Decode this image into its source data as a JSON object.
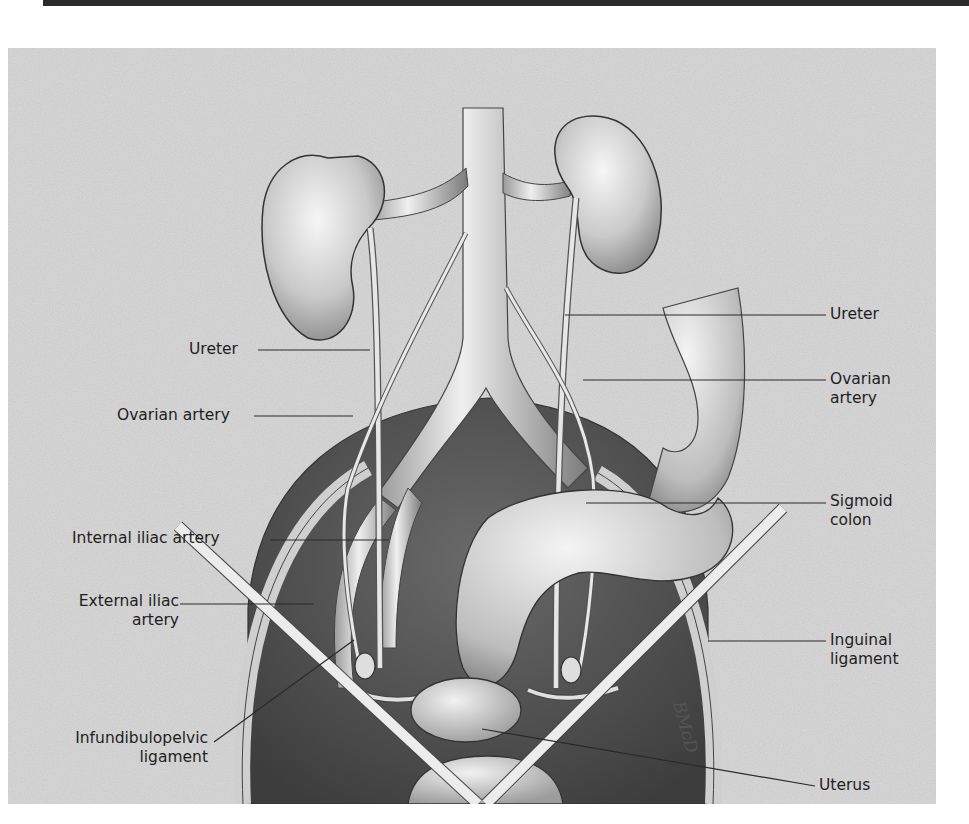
{
  "figure": {
    "type": "anatomical illustration",
    "artist_signature": "BMcD",
    "colors": {
      "background": "#d9d9d9",
      "organ_light": "#ededed",
      "organ_dark": "#4a4a4a",
      "outline": "#333333",
      "leader_line": "#2a2a2a",
      "rule": "#2b2b2b"
    }
  },
  "labels": {
    "left": [
      {
        "text": "Ureter"
      },
      {
        "text": "Ovarian artery"
      },
      {
        "text": "Internal iliac artery"
      },
      {
        "line1": "External iliac",
        "line2": "artery"
      },
      {
        "line1": "Infundibulopelvic",
        "line2": "ligament"
      }
    ],
    "right": [
      {
        "text": "Ureter"
      },
      {
        "line1": "Ovarian",
        "line2": "artery"
      },
      {
        "line1": "Sigmoid",
        "line2": "colon"
      },
      {
        "line1": "Inguinal",
        "line2": "ligament"
      },
      {
        "text": "Uterus"
      }
    ]
  }
}
